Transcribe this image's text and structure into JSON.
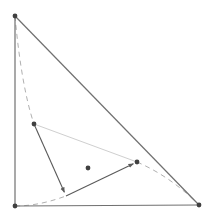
{
  "diagram": {
    "type": "geometry-simplex-iteration",
    "colors": {
      "edge": "#707070",
      "dashed_curve": "#b0b0b0",
      "chord": "#cfcfcf",
      "arrow": "#5a5a5a",
      "point": "#404040"
    },
    "triangle": {
      "vertices": [
        {
          "id": "top",
          "x": 15,
          "y": 16
        },
        {
          "id": "bottom-left",
          "x": 15,
          "y": 206
        },
        {
          "id": "bottom-right",
          "x": 199,
          "y": 205
        }
      ]
    },
    "points": [
      {
        "id": "left-point",
        "x": 34,
        "y": 124
      },
      {
        "id": "foot-point",
        "x": 66,
        "y": 196
      },
      {
        "id": "right-point",
        "x": 137,
        "y": 162
      },
      {
        "id": "center-point",
        "x": 88,
        "y": 168
      }
    ],
    "chord": {
      "from": "left-point",
      "to": "right-point"
    },
    "arrows": [
      {
        "from": "left-point",
        "to": "foot-point"
      },
      {
        "from": "foot-point",
        "to": "right-point"
      }
    ],
    "dashed_curves": [
      {
        "id": "upper-branch",
        "d": "M15,16 C18,50 24,95 34,124"
      },
      {
        "id": "lower-branch",
        "d": "M15,206 C35,206 52,201 66,196"
      },
      {
        "id": "right-branch",
        "d": "M137,162 C160,172 180,186 199,205"
      }
    ]
  }
}
